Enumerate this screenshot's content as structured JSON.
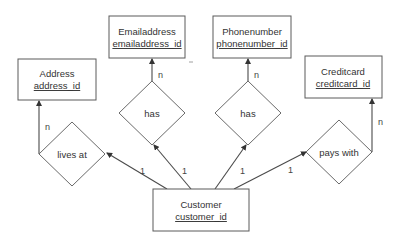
{
  "diagram": {
    "type": "entity-relationship",
    "entities": [
      {
        "id": "address",
        "name": "Address",
        "key": "address_id"
      },
      {
        "id": "emailaddress",
        "name": "Emailaddress",
        "key": "emailaddress_id"
      },
      {
        "id": "phonenumber",
        "name": "Phonenumber",
        "key": "phonenumber_id"
      },
      {
        "id": "creditcard",
        "name": "Creditcard",
        "key": "creditcard_id"
      },
      {
        "id": "customer",
        "name": "Customer",
        "key": "customer_id"
      }
    ],
    "relationships": [
      {
        "id": "lives_at",
        "label": "lives at",
        "from": "customer",
        "to": "address",
        "from_card": "1",
        "to_card": "n"
      },
      {
        "id": "has_email",
        "label": "has",
        "from": "customer",
        "to": "emailaddress",
        "from_card": "1",
        "to_card": "n"
      },
      {
        "id": "has_phone",
        "label": "has",
        "from": "customer",
        "to": "phonenumber",
        "from_card": "1",
        "to_card": "n"
      },
      {
        "id": "pays_with",
        "label": "pays with",
        "from": "customer",
        "to": "creditcard",
        "from_card": "1",
        "to_card": "n"
      }
    ]
  }
}
